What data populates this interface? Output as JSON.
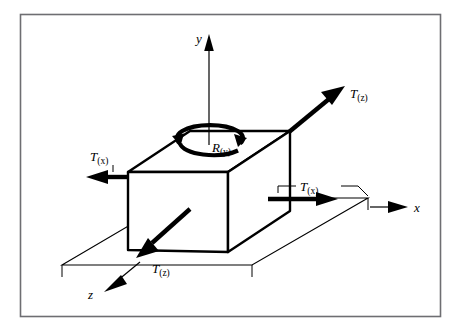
{
  "figure": {
    "background_color": "#ffffff",
    "frame_color": "#6e6e72",
    "ink_color": "#000000"
  },
  "axes": {
    "y": {
      "label": "y",
      "direction": "up"
    },
    "x": {
      "label": "x",
      "direction": "right"
    },
    "z": {
      "label": "z",
      "direction": "down-left"
    }
  },
  "vectors": {
    "t_x_left": {
      "symbol": "T",
      "subscript": "(x)",
      "label": "T(x)",
      "direction": "left"
    },
    "t_x_right": {
      "symbol": "T",
      "subscript": "(x)",
      "label": "T(x)",
      "direction": "right"
    },
    "t_z_upper": {
      "symbol": "T",
      "subscript": "(z)",
      "label": "T(z)",
      "direction": "up-right"
    },
    "t_z_lower": {
      "symbol": "T",
      "subscript": "(z)",
      "label": "T(z)",
      "direction": "down-left"
    }
  },
  "rotation": {
    "r_y": {
      "symbol": "R",
      "subscript": "(y)",
      "label": "R(y)",
      "sense": "about-y-axis"
    }
  }
}
